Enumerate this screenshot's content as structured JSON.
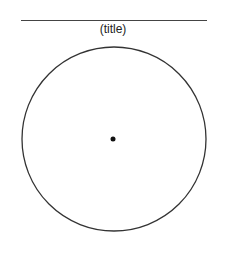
{
  "diagram": {
    "title": "(title)",
    "colors": {
      "stroke": "#333333",
      "rule": "#444444",
      "dot": "#111111",
      "background": "#ffffff"
    },
    "circle": {
      "cx": 114,
      "cy": 139,
      "r": 92
    },
    "center_dot": {
      "cx": 113,
      "cy": 139,
      "r": 2.5
    },
    "rule": {
      "x1": 21,
      "x2": 207,
      "y": 20
    }
  }
}
